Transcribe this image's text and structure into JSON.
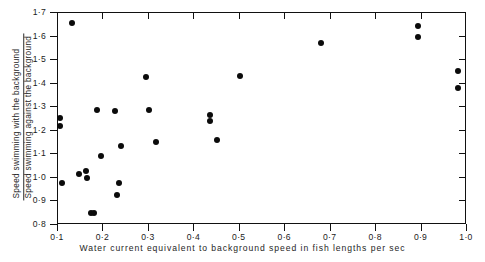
{
  "chart_data": {
    "type": "scatter",
    "title": "",
    "xlabel": "Water current equivalent to background speed in fish lengths per sec",
    "ylabel_numerator": "Speed swimming with the background",
    "ylabel_denominator": "Speed swimming against the background",
    "xlim": [
      0.1,
      1.0
    ],
    "ylim": [
      0.8,
      1.7
    ],
    "xticks": [
      0.1,
      0.2,
      0.3,
      0.4,
      0.5,
      0.6,
      0.7,
      0.8,
      0.9,
      1.0
    ],
    "yticks": [
      0.8,
      0.9,
      1.0,
      1.1,
      1.2,
      1.3,
      1.4,
      1.5,
      1.6,
      1.7
    ],
    "xtick_labels": [
      "0·1",
      "0·2",
      "0·3",
      "0·4",
      "0·5",
      "0·6",
      "0·7",
      "0·8",
      "0·9",
      "1·0"
    ],
    "ytick_labels": [
      "0·8",
      "0·9",
      "1·0",
      "1·1",
      "1·2",
      "1·3",
      "1·4",
      "1·5",
      "1·6",
      "1·7"
    ],
    "grid": false,
    "legend": false,
    "marker": "filled-circle",
    "marker_color": "#0b0b0b",
    "points": [
      {
        "x": 0.106,
        "y": 1.25
      },
      {
        "x": 0.106,
        "y": 1.218
      },
      {
        "x": 0.112,
        "y": 0.975
      },
      {
        "x": 0.133,
        "y": 1.655
      },
      {
        "x": 0.148,
        "y": 1.013
      },
      {
        "x": 0.163,
        "y": 1.026
      },
      {
        "x": 0.165,
        "y": 0.996
      },
      {
        "x": 0.174,
        "y": 0.845
      },
      {
        "x": 0.182,
        "y": 0.845
      },
      {
        "x": 0.188,
        "y": 1.282
      },
      {
        "x": 0.196,
        "y": 1.087
      },
      {
        "x": 0.228,
        "y": 1.278
      },
      {
        "x": 0.231,
        "y": 0.922
      },
      {
        "x": 0.236,
        "y": 0.975
      },
      {
        "x": 0.241,
        "y": 1.133
      },
      {
        "x": 0.296,
        "y": 1.425
      },
      {
        "x": 0.302,
        "y": 1.282
      },
      {
        "x": 0.317,
        "y": 1.148
      },
      {
        "x": 0.437,
        "y": 1.262
      },
      {
        "x": 0.437,
        "y": 1.238
      },
      {
        "x": 0.451,
        "y": 1.155
      },
      {
        "x": 0.503,
        "y": 1.428
      },
      {
        "x": 0.681,
        "y": 1.568
      },
      {
        "x": 0.894,
        "y": 1.642
      },
      {
        "x": 0.894,
        "y": 1.592
      },
      {
        "x": 0.982,
        "y": 1.448
      },
      {
        "x": 0.982,
        "y": 1.378
      }
    ]
  },
  "axes": {
    "x_label": "Water current equivalent to background speed in fish lengths per sec",
    "y_label_numerator": "Speed swimming with the background",
    "y_label_denominator": "Speed swimming against the background"
  }
}
